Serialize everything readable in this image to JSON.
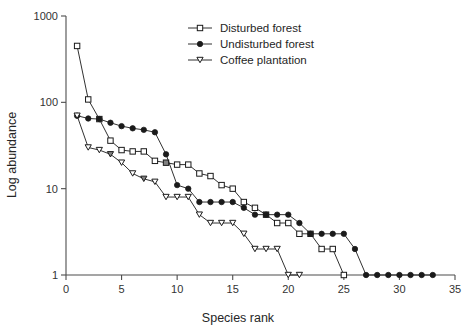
{
  "chart_data": {
    "type": "line",
    "title": "",
    "xlabel": "Species rank",
    "ylabel": "Log abundance",
    "xlim": [
      0,
      35
    ],
    "ylim": [
      1,
      1000
    ],
    "yscale": "log",
    "grid": false,
    "legend_position": "top-center",
    "xticks": [
      0,
      5,
      10,
      15,
      20,
      25,
      30,
      35
    ],
    "xtick_labels": [
      "0",
      "5",
      "10",
      "15",
      "20",
      "25",
      "30",
      "35"
    ],
    "yticks": [
      1,
      10,
      100,
      1000
    ],
    "ytick_labels": [
      "1",
      "10",
      "100",
      "1000"
    ],
    "series": [
      {
        "name": "Disturbed forest",
        "marker": "open-square",
        "x": [
          1,
          2,
          3,
          4,
          5,
          6,
          7,
          8,
          9,
          10,
          11,
          12,
          13,
          14,
          15,
          16,
          17,
          18,
          19,
          20,
          21,
          22,
          23,
          24,
          25
        ],
        "values": [
          450,
          108,
          64,
          36,
          28,
          27,
          27,
          21,
          20,
          19,
          19,
          15,
          14,
          11,
          10,
          7,
          6,
          5,
          4,
          4,
          3,
          3,
          2,
          2,
          1
        ],
        "highlighted_points": [
          {
            "x": 9,
            "y": 20
          },
          {
            "x": 18,
            "y": 5
          },
          {
            "x": 22,
            "y": 3
          }
        ]
      },
      {
        "name": "Undisturbed forest",
        "marker": "filled-circle",
        "x": [
          1,
          2,
          3,
          4,
          5,
          6,
          7,
          8,
          9,
          10,
          11,
          12,
          13,
          14,
          15,
          16,
          17,
          18,
          19,
          20,
          21,
          22,
          23,
          24,
          25,
          26,
          27,
          28,
          29,
          30,
          31,
          32,
          33
        ],
        "values": [
          70,
          65,
          64,
          58,
          53,
          50,
          48,
          45,
          25,
          11,
          10,
          7,
          7,
          7,
          7,
          6,
          5,
          5,
          5,
          5,
          4,
          3,
          3,
          3,
          3,
          2,
          1,
          1,
          1,
          1,
          1,
          1,
          1
        ]
      },
      {
        "name": "Coffee plantation",
        "marker": "open-down-triangle",
        "x": [
          1,
          2,
          3,
          4,
          5,
          6,
          7,
          8,
          9,
          10,
          11,
          12,
          13,
          14,
          15,
          16,
          17,
          18,
          19,
          20,
          21
        ],
        "values": [
          70,
          30,
          28,
          25,
          20,
          15,
          13,
          12,
          8,
          8,
          8,
          5,
          4,
          4,
          4,
          3,
          2,
          2,
          2,
          1,
          1
        ],
        "highlighted_points": [
          {
            "x": 4,
            "y": 25
          },
          {
            "x": 7,
            "y": 13
          }
        ]
      }
    ],
    "colors": {
      "line": "#1a1a1a",
      "marker_fill": "#ffffff",
      "marker_stroke": "#1a1a1a",
      "highlight_fill": "#808080",
      "axis": "#4d4d4d"
    }
  }
}
